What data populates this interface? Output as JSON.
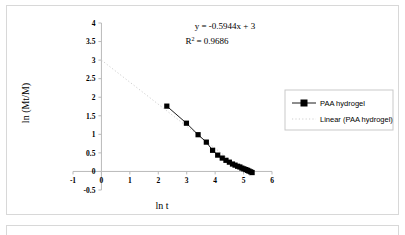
{
  "chart_data": {
    "type": "scatter",
    "title": "",
    "xlabel": "ln t",
    "ylabel": "ln (Mt/M)",
    "xlim": [
      -1,
      6
    ],
    "ylim": [
      -0.5,
      4
    ],
    "xticks": [
      "-1",
      "0",
      "1",
      "2",
      "3",
      "4",
      "5",
      "6"
    ],
    "xtick_values": [
      -1,
      0,
      1,
      2,
      3,
      4,
      5,
      6
    ],
    "yticks": [
      "-0.5",
      "0",
      "0.5",
      "1",
      "1.5",
      "2",
      "2.5",
      "3",
      "3.5",
      "4"
    ],
    "ytick_values": [
      -0.5,
      0,
      0.5,
      1,
      1.5,
      2,
      2.5,
      3,
      3.5,
      4
    ],
    "grid": false,
    "legend_position": "right",
    "annotations": {
      "equation": "y = -0.5944x + 3",
      "r_squared_label": "R",
      "r_squared_exponent": "2",
      "r_squared_value": "= 0.9686"
    },
    "series": [
      {
        "name": "PAA hydrogel",
        "marker": "square",
        "color": "#000000",
        "x": [
          2.3,
          2.99,
          3.4,
          3.69,
          3.91,
          4.09,
          4.25,
          4.38,
          4.5,
          4.61,
          4.7,
          4.79,
          4.87,
          4.94,
          5.01,
          5.08,
          5.14,
          5.19,
          5.25,
          5.3
        ],
        "y": [
          1.76,
          1.3,
          0.99,
          0.79,
          0.57,
          0.44,
          0.36,
          0.3,
          0.25,
          0.2,
          0.17,
          0.14,
          0.12,
          0.09,
          0.07,
          0.05,
          0.03,
          0.01,
          -0.01,
          -0.03
        ]
      },
      {
        "name": "Linear (PAA hydrogel)",
        "type": "trendline",
        "style": "dotted",
        "color": "#cfcfcf",
        "slope": -0.5944,
        "intercept": 3,
        "x_range": [
          0,
          5.3
        ]
      }
    ],
    "legend": [
      {
        "label": "PAA hydrogel",
        "marker": "square-line"
      },
      {
        "label": "Linear (PAA hydrogel)",
        "marker": "dotted-line"
      }
    ]
  }
}
